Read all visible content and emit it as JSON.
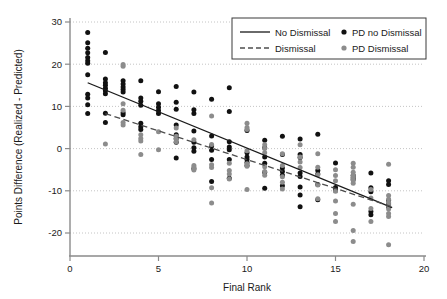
{
  "chart_data": {
    "type": "scatter",
    "title": "",
    "xlabel": "Final Rank",
    "ylabel": "Points Difference (Realized - Predicted)",
    "xlim": [
      0,
      20
    ],
    "ylim": [
      -24,
      30
    ],
    "xticks": [
      0,
      5,
      10,
      15,
      20
    ],
    "yticks": [
      30,
      20,
      10,
      0,
      -10,
      -20
    ],
    "xticklabels": [
      "0",
      "5",
      "10",
      "15",
      "20"
    ],
    "yticklabels": [
      "30",
      "20",
      "10",
      "0",
      "-10",
      "-20"
    ],
    "grid": "horizontal-dotted",
    "legend_position": "top-right",
    "colors": {
      "no_dismissal_points": "#111111",
      "dismissal_points": "#8c8c8c",
      "no_dismissal_line": "#1a1a1a",
      "dismissal_line": "#4d4d4d",
      "grid": "#bdbdbd",
      "axis": "#8a8a8a",
      "background": "#ffffff"
    },
    "legend": [
      {
        "key": "no-dismissal-line",
        "label": "No Dismissal",
        "marker": "solid-line",
        "color": "#1a1a1a"
      },
      {
        "key": "dismissal-line",
        "label": "Dismissal",
        "marker": "dashed-line",
        "color": "#4d4d4d"
      },
      {
        "key": "pd-no-dismissal-points",
        "label": "PD no Dismissal",
        "marker": "dot",
        "color": "#111111"
      },
      {
        "key": "pd-dismissal-points",
        "label": "PD Dismissal",
        "marker": "dot",
        "color": "#8c8c8c"
      }
    ],
    "series": [
      {
        "name": "PD no Dismissal",
        "type": "scatter",
        "color": "#111111",
        "points": [
          [
            1,
            27.5
          ],
          [
            1,
            25.1
          ],
          [
            1,
            23.8
          ],
          [
            1,
            22.7
          ],
          [
            1,
            21.6
          ],
          [
            1,
            20.8
          ],
          [
            1,
            20.2
          ],
          [
            1,
            17.5
          ],
          [
            1,
            12.9
          ],
          [
            1,
            12.0
          ],
          [
            1,
            10.4
          ],
          [
            1,
            8.3
          ],
          [
            2,
            22.8
          ],
          [
            2,
            16.5
          ],
          [
            2,
            15.6
          ],
          [
            2,
            15.0
          ],
          [
            2,
            14.3
          ],
          [
            2,
            13.7
          ],
          [
            2,
            13.0
          ],
          [
            2,
            8.4
          ],
          [
            2,
            6.2
          ],
          [
            3,
            16.1
          ],
          [
            3,
            15.3
          ],
          [
            3,
            14.6
          ],
          [
            3,
            14.0
          ],
          [
            3,
            13.4
          ],
          [
            3,
            8.5
          ],
          [
            3,
            8.0
          ],
          [
            4,
            16.1
          ],
          [
            4,
            12.0
          ],
          [
            4,
            11.2
          ],
          [
            4,
            10.3
          ],
          [
            4,
            6.0
          ],
          [
            4,
            5.2
          ],
          [
            4,
            4.5
          ],
          [
            5,
            13.5
          ],
          [
            5,
            10.6
          ],
          [
            5,
            9.8
          ],
          [
            5,
            9.0
          ],
          [
            5,
            8.3
          ],
          [
            6,
            14.7
          ],
          [
            6,
            11.0
          ],
          [
            6,
            9.3
          ],
          [
            6,
            5.6
          ],
          [
            6,
            3.3
          ],
          [
            6,
            2.4
          ],
          [
            6,
            1.5
          ],
          [
            6,
            -2.2
          ],
          [
            7,
            13.4
          ],
          [
            7,
            9.2
          ],
          [
            7,
            8.3
          ],
          [
            7,
            4.2
          ],
          [
            7,
            1.5
          ],
          [
            7,
            0.2
          ],
          [
            7,
            -0.6
          ],
          [
            7,
            -4.8
          ],
          [
            8,
            11.7
          ],
          [
            8,
            3.0
          ],
          [
            8,
            0.6
          ],
          [
            8,
            -0.4
          ],
          [
            8,
            -2.6
          ],
          [
            8,
            -7.8
          ],
          [
            9,
            14.4
          ],
          [
            9,
            8.8
          ],
          [
            9,
            1.6
          ],
          [
            9,
            0.4
          ],
          [
            9,
            -0.3
          ],
          [
            9,
            -2.6
          ],
          [
            9,
            -7.0
          ],
          [
            10,
            4.3
          ],
          [
            10,
            -1.0
          ],
          [
            10,
            -2.0
          ],
          [
            10,
            -2.6
          ],
          [
            10,
            -3.3
          ],
          [
            10,
            -4.0
          ],
          [
            11,
            2.0
          ],
          [
            11,
            0.2
          ],
          [
            11,
            -2.0
          ],
          [
            11,
            -3.5
          ],
          [
            11,
            -5.6
          ],
          [
            11,
            -9.4
          ],
          [
            12,
            2.9
          ],
          [
            12,
            -1.4
          ],
          [
            12,
            -4.6
          ],
          [
            12,
            -5.4
          ],
          [
            12,
            -6.3
          ],
          [
            12,
            -8.8
          ],
          [
            13,
            2.3
          ],
          [
            13,
            -1.4
          ],
          [
            13,
            -2.1
          ],
          [
            13,
            -5.8
          ],
          [
            13,
            -6.6
          ],
          [
            13,
            -9.1
          ],
          [
            13,
            -11.0
          ],
          [
            13,
            -13.8
          ],
          [
            14,
            3.4
          ],
          [
            14,
            -5.2
          ],
          [
            14,
            -6.0
          ],
          [
            14,
            -8.5
          ],
          [
            14,
            -12.1
          ],
          [
            15,
            -3.4
          ],
          [
            15,
            -9.2
          ],
          [
            15,
            -9.9
          ],
          [
            16,
            -6.4
          ],
          [
            16,
            -6.9
          ],
          [
            16,
            -7.3
          ],
          [
            17,
            -5.8
          ],
          [
            17,
            -9.3
          ],
          [
            17,
            -10.2
          ],
          [
            17,
            -14.9
          ],
          [
            17,
            -15.7
          ],
          [
            18,
            -7.6
          ],
          [
            18,
            -8.5
          ],
          [
            18,
            -12.3
          ],
          [
            18,
            -13.1
          ],
          [
            18,
            -13.8
          ]
        ]
      },
      {
        "name": "PD Dismissal",
        "type": "scatter",
        "color": "#8c8c8c",
        "points": [
          [
            2,
            1.1
          ],
          [
            3,
            19.9
          ],
          [
            3,
            19.5
          ],
          [
            3,
            10.6
          ],
          [
            3,
            9.1
          ],
          [
            3,
            6.2
          ],
          [
            3,
            5.6
          ],
          [
            4,
            3.3
          ],
          [
            4,
            2.4
          ],
          [
            4,
            1.8
          ],
          [
            4,
            -1.4
          ],
          [
            5,
            4.0
          ],
          [
            5,
            -0.3
          ],
          [
            6,
            4.9
          ],
          [
            6,
            2.9
          ],
          [
            6,
            2.2
          ],
          [
            6,
            1.6
          ],
          [
            7,
            2.1
          ],
          [
            7,
            -4.0
          ],
          [
            7,
            -4.4
          ],
          [
            7,
            -5.1
          ],
          [
            8,
            7.7
          ],
          [
            8,
            1.0
          ],
          [
            8,
            -3.8
          ],
          [
            8,
            -4.5
          ],
          [
            8,
            -9.3
          ],
          [
            8,
            -12.9
          ],
          [
            9,
            -3.5
          ],
          [
            9,
            -5.2
          ],
          [
            9,
            -6.0
          ],
          [
            9,
            -7.2
          ],
          [
            10,
            6.0
          ],
          [
            10,
            5.0
          ],
          [
            10,
            4.5
          ],
          [
            10,
            -0.5
          ],
          [
            10,
            -3.6
          ],
          [
            10,
            -4.2
          ],
          [
            10,
            -9.7
          ],
          [
            11,
            0.9
          ],
          [
            11,
            0.0
          ],
          [
            11,
            -1.0
          ],
          [
            11,
            -4.3
          ],
          [
            11,
            -5.4
          ],
          [
            11,
            -6.3
          ],
          [
            12,
            -1.2
          ],
          [
            12,
            -4.0
          ],
          [
            12,
            -6.7
          ],
          [
            12,
            -8.0
          ],
          [
            12,
            -9.6
          ],
          [
            13,
            0.9
          ],
          [
            13,
            -2.0
          ],
          [
            13,
            -3.2
          ],
          [
            13,
            -4.5
          ],
          [
            14,
            -1.2
          ],
          [
            14,
            -4.4
          ],
          [
            14,
            -6.2
          ],
          [
            14,
            -8.6
          ],
          [
            14,
            -11.9
          ],
          [
            15,
            -5.0
          ],
          [
            15,
            -6.4
          ],
          [
            15,
            -7.6
          ],
          [
            15,
            -10.1
          ],
          [
            15,
            -12.4
          ],
          [
            15,
            -15.4
          ],
          [
            15,
            -17.3
          ],
          [
            16,
            -3.5
          ],
          [
            16,
            -4.4
          ],
          [
            16,
            -5.6
          ],
          [
            16,
            -6.4
          ],
          [
            16,
            -6.9
          ],
          [
            16,
            -7.5
          ],
          [
            16,
            -8.2
          ],
          [
            16,
            -13.2
          ],
          [
            16,
            -19.4
          ],
          [
            16,
            -22.0
          ],
          [
            17,
            -9.7
          ],
          [
            17,
            -11.7
          ],
          [
            17,
            -14.2
          ],
          [
            17,
            -17.3
          ],
          [
            18,
            -3.7
          ],
          [
            18,
            -11.1
          ],
          [
            18,
            -12.0
          ],
          [
            18,
            -12.8
          ],
          [
            18,
            -13.5
          ],
          [
            18,
            -14.3
          ],
          [
            18,
            -15.4
          ],
          [
            18,
            -16.1
          ],
          [
            18,
            -22.8
          ]
        ]
      }
    ],
    "trend_lines": [
      {
        "name": "No Dismissal",
        "style": "solid",
        "color": "#1a1a1a",
        "x_start": 1.0,
        "y_start": 15.6,
        "x_end": 18.2,
        "y_end": -14.0
      },
      {
        "name": "Dismissal",
        "style": "dashed",
        "color": "#4d4d4d",
        "x_start": 2.0,
        "y_start": 8.3,
        "x_end": 18.2,
        "y_end": -13.8
      }
    ]
  }
}
